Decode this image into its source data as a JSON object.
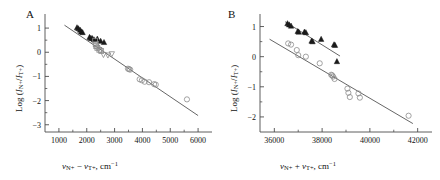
{
  "figure": {
    "width": 440,
    "height": 180,
    "background": "#ffffff",
    "axis_color": "#4d4d4d",
    "marker_fill_color": "#1a1a1a",
    "marker_open_color": "#8c8c8c",
    "fitline_color": "#555555"
  },
  "panels": [
    {
      "id": "A",
      "label": "A",
      "xlabel_parts": {
        "v1": "v",
        "sub1": "N+",
        "operator": " − ",
        "v2": "v",
        "sub2": "T+",
        "units": ", cm",
        "exp": "−1"
      },
      "ylabel_parts": {
        "log": "Log (",
        "i1": "I",
        "sub1": "N+",
        "slash": "/",
        "i2": "I",
        "sub2": "T+",
        "close": ")"
      },
      "xticks": [
        1000,
        2000,
        3000,
        4000,
        5000,
        6000
      ],
      "xtick_labels": [
        "1000",
        "2000",
        "3000",
        "4000",
        "5000",
        "6000"
      ],
      "yticks": [
        1,
        0,
        -1,
        -2,
        -3
      ],
      "ytick_labels": [
        "1",
        "0",
        "−1",
        "−2",
        "−3"
      ],
      "xlim": [
        500,
        6500
      ],
      "ylim": [
        -3.3,
        1.5
      ],
      "minor_x_between": 1,
      "minor_y_between": 1
    },
    {
      "id": "B",
      "label": "B",
      "xlabel_parts": {
        "v1": "v",
        "sub1": "N+",
        "operator": " + ",
        "v2": "v",
        "sub2": "T+",
        "units": ", cm",
        "exp": "−1"
      },
      "ylabel_parts": {
        "log": "Log (",
        "i1": "I",
        "sub1": "N+",
        "slash": "/",
        "i2": "I",
        "sub2": "T+",
        "close": ")"
      },
      "xticks": [
        36000,
        38000,
        40000,
        42000
      ],
      "xtick_labels": [
        "36000",
        "38000",
        "40000",
        "42000"
      ],
      "yticks": [
        1,
        0,
        -1,
        -2
      ],
      "ytick_labels": [
        "1",
        "0",
        "−1",
        "−2"
      ],
      "xlim": [
        35400,
        42600
      ],
      "ylim": [
        -2.5,
        1.35
      ],
      "minor_x_between": 1,
      "minor_y_between": 1
    }
  ],
  "chart_data": [
    {
      "type": "scatter",
      "panel": "A",
      "title": "A",
      "xlabel": "v_N+ - v_T+, cm^-1",
      "ylabel": "Log (I_N+/I_T+)",
      "xlim": [
        500,
        6500
      ],
      "ylim": [
        -3.3,
        1.5
      ],
      "grid": false,
      "legend": "none",
      "series": [
        {
          "name": "filled-triangles",
          "marker": "triangle-up-filled",
          "x": [
            1650,
            1700,
            1760,
            1800,
            1850,
            2100,
            2150,
            2200,
            2260,
            2380,
            2500,
            2620
          ],
          "y": [
            1.02,
            0.98,
            0.92,
            0.85,
            0.82,
            0.62,
            0.58,
            0.57,
            0.52,
            0.55,
            0.46,
            0.41
          ]
        },
        {
          "name": "open-squares",
          "marker": "square-open",
          "x": [
            2300,
            2320,
            2340,
            2380,
            2450,
            2520
          ],
          "y": [
            0.48,
            0.33,
            0.25,
            0.18,
            0.1,
            0.05
          ]
        },
        {
          "name": "open-down-triangles",
          "marker": "triangle-down-open",
          "x": [
            2600,
            2760,
            2900
          ],
          "y": [
            -0.1,
            -0.12,
            -0.07
          ]
        },
        {
          "name": "open-circles",
          "marker": "circle-open",
          "x": [
            2380,
            2480,
            3480,
            3520,
            3560,
            3900,
            3980,
            4080,
            4240,
            4420,
            4480,
            5600
          ],
          "y": [
            0.22,
            0.1,
            -0.68,
            -0.7,
            -0.72,
            -1.12,
            -1.16,
            -1.22,
            -1.24,
            -1.32,
            -1.34,
            -1.95
          ]
        }
      ],
      "fit_lines": [
        {
          "name": "overall-fit",
          "x": [
            1200,
            6000
          ],
          "y": [
            1.12,
            -2.62
          ]
        }
      ]
    },
    {
      "type": "scatter",
      "panel": "B",
      "title": "B",
      "xlabel": "v_N+ + v_T+, cm^-1",
      "ylabel": "Log (I_N+/I_T+)",
      "xlim": [
        35400,
        42600
      ],
      "ylim": [
        -2.5,
        1.35
      ],
      "grid": false,
      "legend": "none",
      "series": [
        {
          "name": "filled-triangles",
          "marker": "triangle-up-filled",
          "x": [
            36550,
            36620,
            36700,
            36980,
            37020,
            37260,
            37320,
            37560,
            37600,
            37960,
            38500,
            38540,
            38620
          ],
          "y": [
            1.1,
            1.06,
            1.02,
            0.84,
            0.82,
            0.82,
            0.8,
            0.52,
            0.5,
            0.58,
            0.4,
            0.38,
            -0.16
          ]
        },
        {
          "name": "open-circles",
          "marker": "circle-open",
          "x": [
            36580,
            36700,
            36940,
            37000,
            37320,
            37900,
            38380,
            38420,
            38460,
            38520,
            39060,
            39100,
            39160,
            39520,
            39580,
            41620
          ],
          "y": [
            0.44,
            0.4,
            0.22,
            0.05,
            0.0,
            -0.22,
            -0.6,
            -0.62,
            -0.66,
            -0.74,
            -1.06,
            -1.2,
            -1.34,
            -1.22,
            -1.36,
            -1.96
          ]
        }
      ],
      "fit_lines": [
        {
          "name": "upper-fit-triangles",
          "x": [
            36450,
            38750
          ],
          "y": [
            1.16,
            0.02
          ]
        },
        {
          "name": "lower-fit-circles",
          "x": [
            35800,
            41800
          ],
          "y": [
            0.58,
            -2.22
          ]
        }
      ]
    }
  ]
}
